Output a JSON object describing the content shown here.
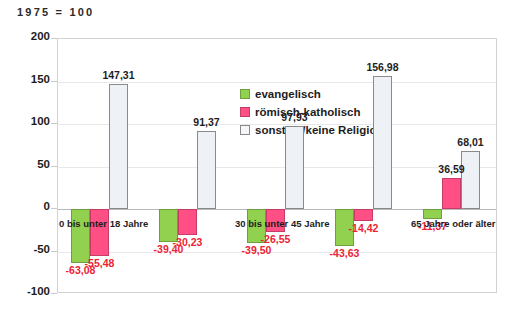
{
  "chart_data": {
    "type": "bar",
    "title": "1975 = 100",
    "xlabel": "",
    "ylabel": "",
    "ylim": [
      -100,
      200
    ],
    "yticks": [
      200,
      150,
      100,
      50,
      0,
      -50,
      -100
    ],
    "ytick_labels": [
      "200",
      "150",
      "100",
      "50",
      "0",
      "-50",
      "-100"
    ],
    "grid": true,
    "legend_position": "inside-top-center",
    "categories": [
      "0 bis unter 18 Jahre",
      "18 bis unter 30 Jahre",
      "30 bis unter 45 Jahre",
      "45 bis unter 65 Jahre",
      "65 Jahre oder älter"
    ],
    "series": [
      {
        "name": "evangelisch",
        "color": "#92d14f",
        "values": [
          -63.08,
          -39.4,
          -39.5,
          -43.63,
          -11.37
        ],
        "labels": [
          "-63,08",
          "-39,40",
          "-39,50",
          "-43,63",
          "-11,37"
        ]
      },
      {
        "name": "römisch-katholisch",
        "color": "#ff4f85",
        "values": [
          -55.48,
          -30.23,
          -26.55,
          -14.42,
          36.59
        ],
        "labels": [
          "-55,48",
          "-30,23",
          "-26,55",
          "-14,42",
          "36,59"
        ]
      },
      {
        "name": "sonstige/keine Religion",
        "color": "#eef1f5",
        "values": [
          147.31,
          91.37,
          97.93,
          156.98,
          68.01
        ],
        "labels": [
          "147,31",
          "91,37",
          "97,93",
          "156,98",
          "68,01"
        ]
      }
    ],
    "visible_category_labels": [
      "0 bis unter 18 Jahre",
      "30 bis unter 45 Jahre",
      "65 Jahre oder älter"
    ]
  },
  "legend": {
    "items": [
      {
        "label": "evangelisch",
        "swatch": "ev"
      },
      {
        "label": "römisch-katholisch",
        "swatch": "rk"
      },
      {
        "label": "sonstige/keine Religion",
        "swatch": "so"
      }
    ]
  }
}
